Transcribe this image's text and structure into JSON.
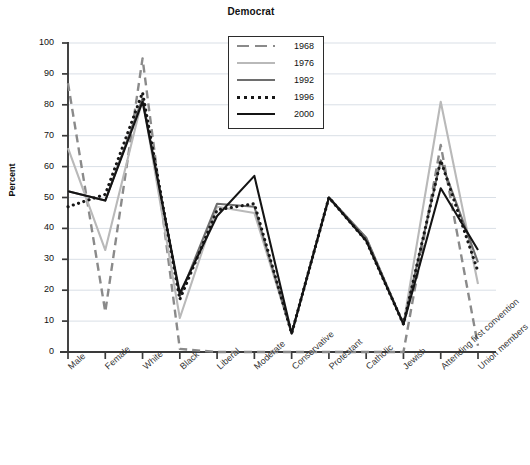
{
  "chart": {
    "title": "Democrat",
    "ylabel": "Percent"
  },
  "legend": {
    "position": "top-center-inside",
    "entries": [
      {
        "label": "1968",
        "color": "#8a8a8a",
        "style": "dashed"
      },
      {
        "label": "1976",
        "color": "#b9b9b9",
        "style": "solid"
      },
      {
        "label": "1992",
        "color": "#6e6e6e",
        "style": "solid"
      },
      {
        "label": "1996",
        "color": "#171717",
        "style": "dotted"
      },
      {
        "label": "2000",
        "color": "#141414",
        "style": "solid"
      }
    ]
  },
  "chart_data": {
    "type": "line",
    "title": "Democrat",
    "xlabel": "",
    "ylabel": "Percent",
    "ylim": [
      0,
      100
    ],
    "ytick_labels": [
      "0",
      "10",
      "20",
      "30",
      "40",
      "50",
      "60",
      "70",
      "80",
      "90",
      "100"
    ],
    "yticks": [
      0,
      10,
      20,
      30,
      40,
      50,
      60,
      70,
      80,
      90,
      100
    ],
    "grid": true,
    "categories": [
      "Male",
      "Female",
      "White",
      "Black",
      "Liberal",
      "Moderate",
      "Conservative",
      "Protestant",
      "Catholic",
      "Jewish",
      "Attending first convention",
      "Union members"
    ],
    "series": [
      {
        "name": "1968",
        "color": "#8a8a8a",
        "style": "dashed",
        "values": [
          87,
          13,
          95,
          1,
          0,
          0,
          0,
          0,
          0,
          0,
          67,
          2
        ]
      },
      {
        "name": "1976",
        "color": "#b9b9b9",
        "style": "solid",
        "values": [
          66,
          33,
          82,
          11,
          47,
          45,
          6,
          50,
          37,
          9,
          81,
          22
        ]
      },
      {
        "name": "1992",
        "color": "#6e6e6e",
        "style": "solid",
        "values": [
          52,
          49,
          82,
          18,
          48,
          47,
          6,
          50,
          37,
          9,
          62,
          29
        ]
      },
      {
        "name": "1996",
        "color": "#171717",
        "style": "dotted",
        "values": [
          47,
          51,
          84,
          17,
          46,
          48,
          6,
          50,
          36,
          9,
          62,
          26
        ]
      },
      {
        "name": "2000",
        "color": "#141414",
        "style": "solid",
        "values": [
          52,
          49,
          81,
          19,
          44,
          57,
          6,
          50,
          36,
          9,
          53,
          33
        ]
      }
    ]
  }
}
